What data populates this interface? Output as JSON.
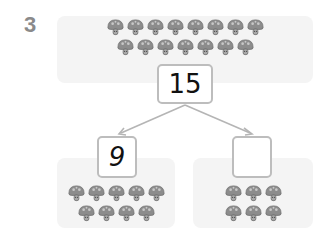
{
  "question": {
    "number": "3"
  },
  "whole": {
    "value": "15",
    "icon": "mushroom-icon",
    "rows": [
      8,
      7
    ]
  },
  "parts": [
    {
      "value": "9",
      "icon": "mushroom-icon",
      "rows": [
        5,
        4
      ]
    },
    {
      "value": "",
      "icon": "mushroom-icon",
      "rows": [
        3,
        3
      ]
    }
  ],
  "colors": {
    "panel": "#f4f4f4",
    "box_border": "#bdbdbd",
    "arrow": "#b5b5b5",
    "mushroom": "#8c8c8c",
    "number_label": "#8a8a8a"
  }
}
